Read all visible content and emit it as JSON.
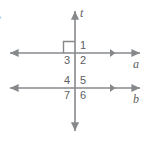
{
  "figure": {
    "colors": {
      "line": "#86898c",
      "text": "#5d6063",
      "background": "#ffffff"
    },
    "lines": [
      {
        "id": "t",
        "label": "t",
        "orientation": "vertical",
        "arrows": "both"
      },
      {
        "id": "a",
        "label": "a",
        "orientation": "horizontal",
        "arrows": "both"
      },
      {
        "id": "b",
        "label": "b",
        "orientation": "horizontal",
        "arrows": "both"
      }
    ],
    "angles": [
      {
        "id": "angle-1",
        "label": "1",
        "position": "upper-intersection-top-right"
      },
      {
        "id": "angle-2",
        "label": "2",
        "position": "upper-intersection-bottom-right"
      },
      {
        "id": "angle-3",
        "label": "3",
        "position": "upper-intersection-bottom-left"
      },
      {
        "id": "angle-4",
        "label": "4",
        "position": "lower-intersection-top-left"
      },
      {
        "id": "angle-5",
        "label": "5",
        "position": "lower-intersection-top-right"
      },
      {
        "id": "angle-6",
        "label": "6",
        "position": "lower-intersection-bottom-right"
      },
      {
        "id": "angle-7",
        "label": "7",
        "position": "lower-intersection-bottom-left"
      }
    ],
    "right_angle_marker": {
      "present": true,
      "position": "upper-intersection-top-left"
    },
    "edge_mark": {
      "label": "•"
    }
  }
}
